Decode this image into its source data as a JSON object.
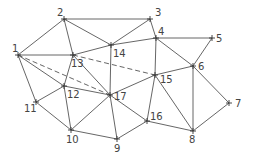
{
  "diagram": {
    "type": "triangulated-network",
    "nodes": [
      {
        "id": "1",
        "x": 18,
        "y": 55,
        "lx": 12,
        "ly": 52
      },
      {
        "id": "2",
        "x": 64,
        "y": 19,
        "lx": 57,
        "ly": 16
      },
      {
        "id": "3",
        "x": 150,
        "y": 19,
        "lx": 155,
        "ly": 16
      },
      {
        "id": "4",
        "x": 156,
        "y": 38,
        "lx": 158,
        "ly": 35
      },
      {
        "id": "5",
        "x": 212,
        "y": 38,
        "lx": 216,
        "ly": 42
      },
      {
        "id": "6",
        "x": 193,
        "y": 66,
        "lx": 198,
        "ly": 70
      },
      {
        "id": "7",
        "x": 229,
        "y": 103,
        "lx": 235,
        "ly": 107
      },
      {
        "id": "8",
        "x": 193,
        "y": 131,
        "lx": 189,
        "ly": 143
      },
      {
        "id": "9",
        "x": 117,
        "y": 139,
        "lx": 114,
        "ly": 152
      },
      {
        "id": "10",
        "x": 71,
        "y": 130,
        "lx": 66,
        "ly": 143
      },
      {
        "id": "11",
        "x": 36,
        "y": 102,
        "lx": 24,
        "ly": 112
      },
      {
        "id": "12",
        "x": 64,
        "y": 86,
        "lx": 67,
        "ly": 98
      },
      {
        "id": "13",
        "x": 73,
        "y": 55,
        "lx": 71,
        "ly": 67
      },
      {
        "id": "14",
        "x": 111,
        "y": 45,
        "lx": 113,
        "ly": 57
      },
      {
        "id": "15",
        "x": 155,
        "y": 75,
        "lx": 160,
        "ly": 83
      },
      {
        "id": "16",
        "x": 147,
        "y": 121,
        "lx": 150,
        "ly": 120
      },
      {
        "id": "17",
        "x": 110,
        "y": 95,
        "lx": 114,
        "ly": 100
      }
    ],
    "edges": [
      {
        "from": "1",
        "to": "2",
        "style": "solid"
      },
      {
        "from": "2",
        "to": "3",
        "style": "solid"
      },
      {
        "from": "3",
        "to": "4",
        "style": "solid"
      },
      {
        "from": "4",
        "to": "5",
        "style": "solid"
      },
      {
        "from": "5",
        "to": "6",
        "style": "solid"
      },
      {
        "from": "6",
        "to": "7",
        "style": "solid"
      },
      {
        "from": "7",
        "to": "8",
        "style": "solid"
      },
      {
        "from": "8",
        "to": "16",
        "style": "solid"
      },
      {
        "from": "16",
        "to": "9",
        "style": "solid"
      },
      {
        "from": "9",
        "to": "10",
        "style": "solid"
      },
      {
        "from": "10",
        "to": "11",
        "style": "solid"
      },
      {
        "from": "11",
        "to": "1",
        "style": "solid"
      },
      {
        "from": "1",
        "to": "13",
        "style": "solid"
      },
      {
        "from": "1",
        "to": "12",
        "style": "solid"
      },
      {
        "from": "1",
        "to": "17",
        "style": "dashed"
      },
      {
        "from": "2",
        "to": "13",
        "style": "solid"
      },
      {
        "from": "2",
        "to": "14",
        "style": "solid"
      },
      {
        "from": "3",
        "to": "14",
        "style": "solid"
      },
      {
        "from": "13",
        "to": "14",
        "style": "solid"
      },
      {
        "from": "14",
        "to": "4",
        "style": "solid"
      },
      {
        "from": "4",
        "to": "6",
        "style": "solid"
      },
      {
        "from": "4",
        "to": "15",
        "style": "solid"
      },
      {
        "from": "14",
        "to": "17",
        "style": "solid"
      },
      {
        "from": "13",
        "to": "15",
        "style": "dashed"
      },
      {
        "from": "13",
        "to": "17",
        "style": "solid"
      },
      {
        "from": "13",
        "to": "12",
        "style": "solid"
      },
      {
        "from": "12",
        "to": "11",
        "style": "solid"
      },
      {
        "from": "12",
        "to": "10",
        "style": "solid"
      },
      {
        "from": "12",
        "to": "17",
        "style": "solid"
      },
      {
        "from": "10",
        "to": "17",
        "style": "solid"
      },
      {
        "from": "17",
        "to": "9",
        "style": "solid"
      },
      {
        "from": "17",
        "to": "16",
        "style": "solid"
      },
      {
        "from": "17",
        "to": "15",
        "style": "solid"
      },
      {
        "from": "15",
        "to": "16",
        "style": "solid"
      },
      {
        "from": "15",
        "to": "8",
        "style": "solid"
      },
      {
        "from": "15",
        "to": "6",
        "style": "solid"
      },
      {
        "from": "6",
        "to": "8",
        "style": "solid"
      }
    ]
  }
}
